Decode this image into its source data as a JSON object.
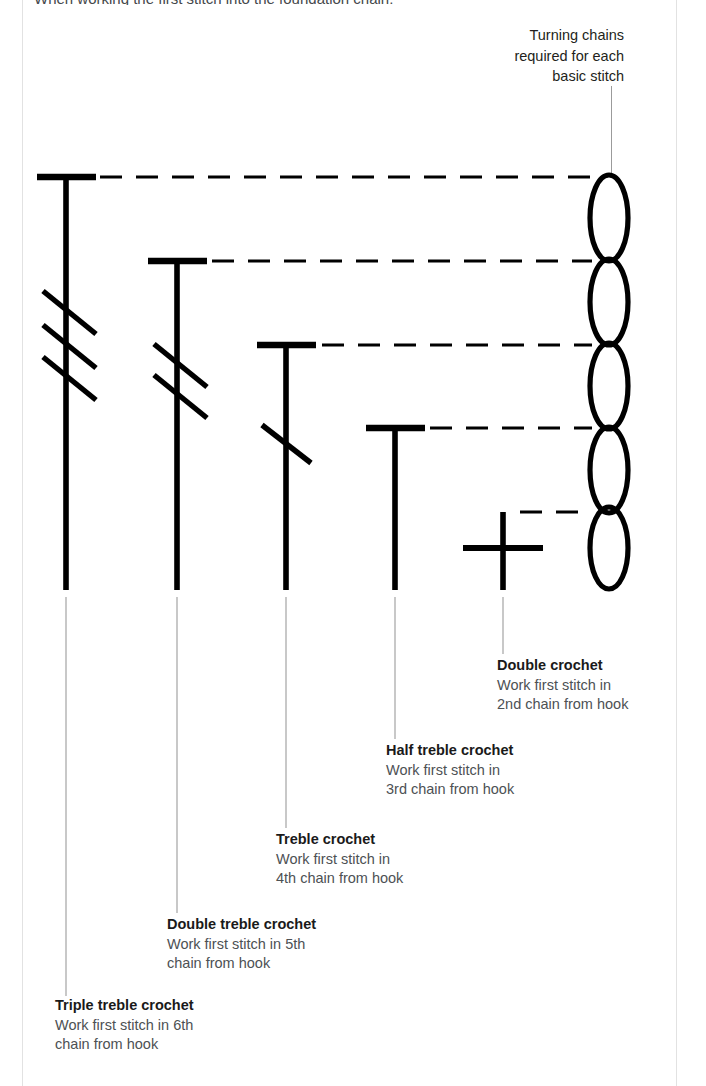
{
  "page": {
    "top_clipped_text": "When working the first stitch into the foundation chain:",
    "background_color": "#ffffff",
    "ink_color": "#000000",
    "leader_line_color": "#9b9b9b"
  },
  "caption": {
    "line1": "Turning chains",
    "line2": "required for each",
    "line3": "basic stitch"
  },
  "chain_stitches": {
    "name": "foundation-chain-loops",
    "count": 5,
    "orientation": "vertical-stack"
  },
  "stitches": [
    {
      "key": "triple_treble",
      "title": "Triple treble crochet",
      "line1": "Work first stitch in 6th",
      "line2": "chain from hook",
      "slashes": 3,
      "turning_chains": 5,
      "symbol": "tall-post-with-three-slashes"
    },
    {
      "key": "double_treble",
      "title": "Double treble crochet",
      "line1": "Work first stitch in 5th",
      "line2": "chain from hook",
      "slashes": 2,
      "turning_chains": 4,
      "symbol": "tall-post-with-two-slashes"
    },
    {
      "key": "treble",
      "title": "Treble crochet",
      "line1": "Work first stitch in",
      "line2": "4th chain from hook",
      "slashes": 1,
      "turning_chains": 3,
      "symbol": "post-with-one-slash"
    },
    {
      "key": "half_treble",
      "title": "Half treble crochet",
      "line1": "Work first stitch in",
      "line2": "3rd chain from hook",
      "slashes": 0,
      "turning_chains": 2,
      "symbol": "t-bar-post"
    },
    {
      "key": "double_crochet",
      "title": "Double crochet",
      "line1": "Work first stitch in",
      "line2": "2nd chain from hook",
      "slashes": 0,
      "turning_chains": 1,
      "symbol": "cross"
    }
  ]
}
